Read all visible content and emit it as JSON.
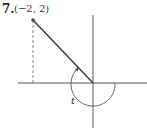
{
  "problem_number": "7.",
  "point_label": "(−2, 2)",
  "angle_label": "t",
  "diagram": {
    "point": {
      "x": -2,
      "y": 2
    },
    "angle": "t",
    "angle_direction": "clockwise from positive x-axis to terminal side",
    "colors": {
      "line": "#444444",
      "axis": "#555555"
    }
  }
}
